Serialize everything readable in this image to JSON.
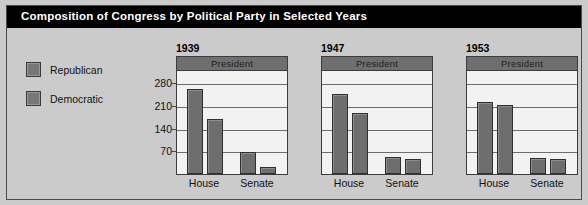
{
  "header": {
    "title": "Composition of Congress by Political Party in Selected Years"
  },
  "legend": {
    "items": [
      {
        "label": "Republican",
        "color": "#777777"
      },
      {
        "label": "Democratic",
        "color": "#777777"
      }
    ]
  },
  "axis": {
    "ticks": [
      70,
      140,
      210,
      280
    ],
    "max": 320
  },
  "panels": [
    {
      "year": "1939",
      "president_label": "President",
      "categories": [
        "House",
        "Senate"
      ]
    },
    {
      "year": "1947",
      "president_label": "President",
      "categories": [
        "House",
        "Senate"
      ]
    },
    {
      "year": "1953",
      "president_label": "President",
      "categories": [
        "House",
        "Senate"
      ]
    }
  ],
  "chart_data": {
    "type": "bar",
    "title": "Composition of Congress by Political Party in Selected Years",
    "xlabel": "",
    "ylabel": "",
    "ylim": [
      0,
      320
    ],
    "yticks": [
      70,
      140,
      210,
      280
    ],
    "grid": true,
    "legend_position": "left",
    "legend_entries": [
      "Republican",
      "Democratic"
    ],
    "annotations": [
      "President"
    ],
    "panels": [
      {
        "year": "1939",
        "categories": [
          "House",
          "Senate"
        ],
        "series": [
          {
            "name": "Democratic",
            "values": [
              262,
              69
            ]
          },
          {
            "name": "Republican",
            "values": [
              169,
              23
            ]
          }
        ]
      },
      {
        "year": "1947",
        "categories": [
          "House",
          "Senate"
        ],
        "series": [
          {
            "name": "Republican",
            "values": [
              246,
              51
            ]
          },
          {
            "name": "Democratic",
            "values": [
              188,
              45
            ]
          }
        ]
      },
      {
        "year": "1953",
        "categories": [
          "House",
          "Senate"
        ],
        "series": [
          {
            "name": "Republican",
            "values": [
              221,
              48
            ]
          },
          {
            "name": "Democratic",
            "values": [
              213,
              47
            ]
          }
        ]
      }
    ]
  }
}
